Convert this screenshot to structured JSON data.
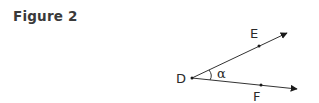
{
  "figure": {
    "title": "Figure 2",
    "labels": {
      "vertex": "D",
      "point_upper": "E",
      "point_lower": "F",
      "angle": "α"
    }
  }
}
